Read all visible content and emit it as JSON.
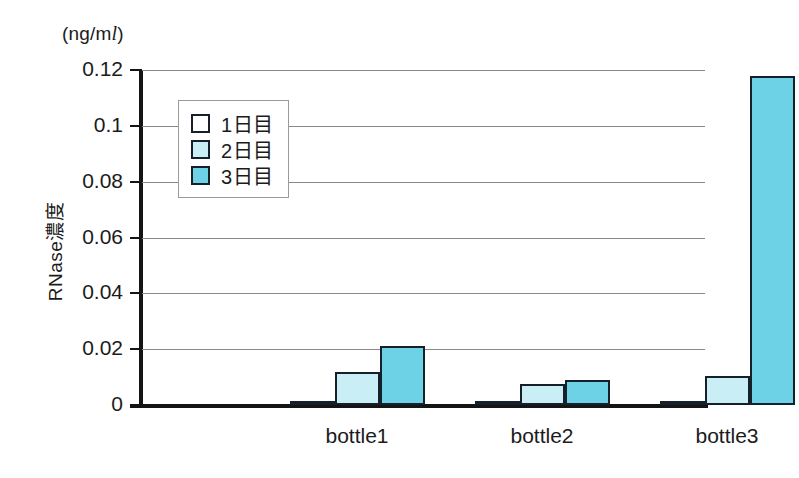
{
  "figure": {
    "unit_caption_prefix": "(ng/m",
    "unit_caption_liter": "l",
    "unit_caption_suffix": ")",
    "y_axis_title": "RNase濃度"
  },
  "legend": {
    "position": "inside-top-left",
    "items": [
      {
        "label": "1日目",
        "color": "#ffffff",
        "swatch": "day1"
      },
      {
        "label": "2日目",
        "color": "#c9eef6",
        "swatch": "day2"
      },
      {
        "label": "3日目",
        "color": "#6ed2e7",
        "swatch": "day3"
      }
    ]
  },
  "chart_data": {
    "type": "bar",
    "title": "",
    "subtitle": "",
    "xlabel": "",
    "ylabel": "RNase濃度",
    "unit": "ng/ml",
    "categories": [
      "bottle1",
      "bottle2",
      "bottle3"
    ],
    "series": [
      {
        "name": "1日目",
        "color": "#ffffff",
        "values": [
          0.001,
          0.001,
          0.0012
        ]
      },
      {
        "name": "2日目",
        "color": "#c9eef6",
        "values": [
          0.012,
          0.0075,
          0.0105
        ]
      },
      {
        "name": "3日目",
        "color": "#6ed2e7",
        "values": [
          0.021,
          0.009,
          0.118
        ]
      }
    ],
    "ylim": [
      0,
      0.12
    ],
    "yticks": [
      0,
      0.02,
      0.04,
      0.06,
      0.08,
      0.1,
      0.12
    ],
    "ytick_labels": [
      "0",
      "0.02",
      "0.04",
      "0.06",
      "0.08",
      "0.1",
      "0.12"
    ],
    "grid": true,
    "grid_axis": "y",
    "legend_position": "upper left"
  }
}
